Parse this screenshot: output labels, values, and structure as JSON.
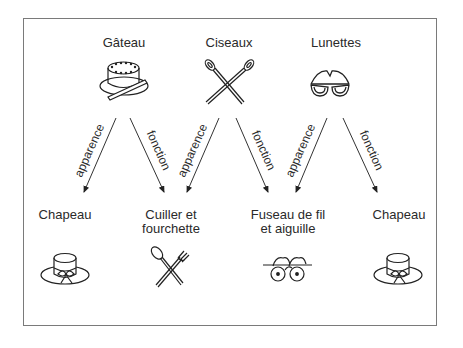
{
  "sources": [
    {
      "label": "Gâteau",
      "icon": "cake-icon"
    },
    {
      "label": "Ciseaux",
      "icon": "scissors-icon"
    },
    {
      "label": "Lunettes",
      "icon": "glasses-icon"
    }
  ],
  "targets": [
    {
      "label_line1": "Chapeau",
      "label_line2": "",
      "icon": "hat-icon"
    },
    {
      "label_line1": "Cuiller et",
      "label_line2": "fourchette",
      "icon": "spoon-fork-icon"
    },
    {
      "label_line1": "Fuseau de fil",
      "label_line2": "et aiguille",
      "icon": "thread-spools-icon"
    },
    {
      "label_line1": "Chapeau",
      "label_line2": "",
      "icon": "hat-icon"
    }
  ],
  "arrows": [
    {
      "from": "Gâteau",
      "to": "Chapeau",
      "label": "apparence"
    },
    {
      "from": "Gâteau",
      "to": "Cuiller et fourchette",
      "label": "fonction"
    },
    {
      "from": "Ciseaux",
      "to": "Cuiller et fourchette",
      "label": "apparence"
    },
    {
      "from": "Ciseaux",
      "to": "Fuseau de fil et aiguille",
      "label": "fonction"
    },
    {
      "from": "Lunettes",
      "to": "Fuseau de fil et aiguille",
      "label": "apparence"
    },
    {
      "from": "Lunettes",
      "to": "Chapeau",
      "label": "fonction"
    }
  ]
}
